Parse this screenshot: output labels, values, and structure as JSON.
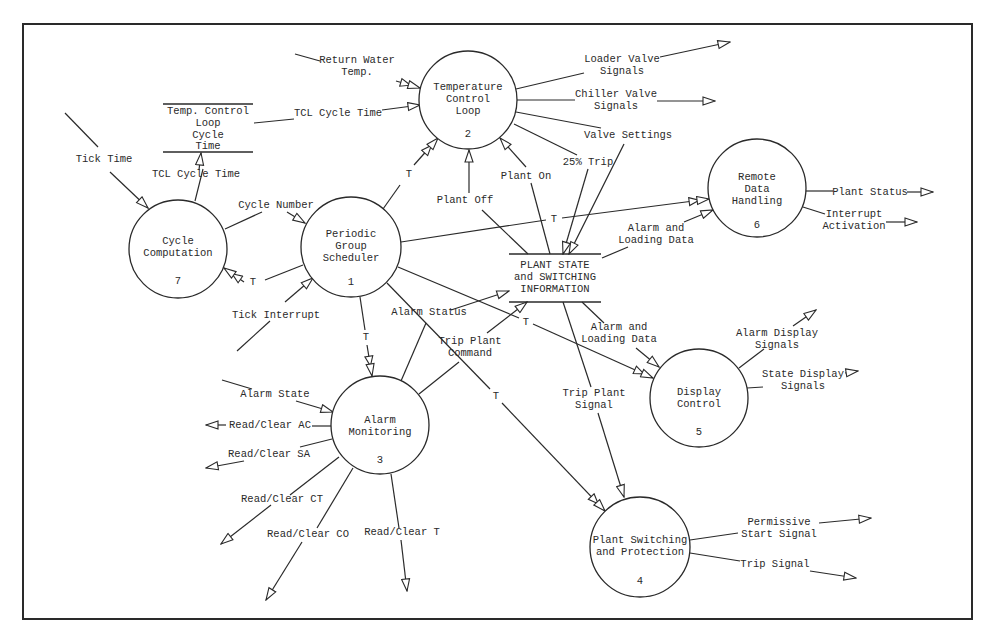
{
  "diagram": {
    "type": "data-flow-diagram",
    "processes": [
      {
        "id": "1",
        "name": "Periodic Group Scheduler",
        "lines": [
          "Periodic",
          "Group",
          "Scheduler"
        ],
        "number": "1",
        "cx": 351,
        "cy": 247,
        "r": 50
      },
      {
        "id": "2",
        "name": "Temperature Control Loop",
        "lines": [
          "Temperature",
          "Control",
          "Loop"
        ],
        "number": "2",
        "cx": 468,
        "cy": 100,
        "r": 49
      },
      {
        "id": "3",
        "name": "Alarm Monitoring",
        "lines": [
          "Alarm",
          "Monitoring"
        ],
        "number": "3",
        "cx": 380,
        "cy": 425,
        "r": 49
      },
      {
        "id": "4",
        "name": "Plant Switching and Protection",
        "lines": [
          "Plant Switching",
          "and Protection"
        ],
        "number": "4",
        "cx": 640,
        "cy": 547,
        "r": 50
      },
      {
        "id": "5",
        "name": "Display Control",
        "lines": [
          "Display",
          "Control"
        ],
        "number": "5",
        "cx": 699,
        "cy": 398,
        "r": 49
      },
      {
        "id": "6",
        "name": "Remote Data Handling",
        "lines": [
          "Remote",
          "Data",
          "Handling"
        ],
        "number": "6",
        "cx": 757,
        "cy": 188,
        "r": 49
      },
      {
        "id": "7",
        "name": "Cycle Computation",
        "lines": [
          "Cycle",
          "Computation"
        ],
        "number": "7",
        "cx": 178,
        "cy": 249,
        "r": 49
      }
    ],
    "data_stores": [
      {
        "id": "tcl-store",
        "lines": [
          "Temp. Control",
          "Loop",
          "Cycle",
          "Time"
        ]
      },
      {
        "id": "plant-store",
        "lines": [
          "PLANT STATE",
          "and SWITCHING",
          "INFORMATION"
        ]
      }
    ],
    "flow_labels": {
      "return_water_temp": [
        "Return Water",
        "Temp."
      ],
      "tcl_cycle_time_to_tcl": "TCL Cycle Time",
      "tcl_cycle_time_from_cc": "TCL Cycle Time",
      "tick_time": "Tick Time",
      "cycle_number": "Cycle Number",
      "t_to_cc": "T",
      "tick_interrupt": "Tick Interrupt",
      "t_to_tcl": "T",
      "t_to_rdh": "T",
      "t_to_am": "T",
      "t_to_dc": "T",
      "t_to_psp": "T",
      "plant_off": "Plant Off",
      "plant_on": "Plant On",
      "loader_valve_signals": [
        "Loader Valve",
        "Signals"
      ],
      "chiller_valve_signals": [
        "Chiller Valve",
        "Signals"
      ],
      "valve_settings": "Valve Settings",
      "trip_25": "25% Trip",
      "alarm_loading_to_rdh": [
        "Alarm and",
        "Loading Data"
      ],
      "alarm_loading_to_dc": [
        "Alarm and",
        "Loading Data"
      ],
      "plant_status": "Plant Status",
      "interrupt_activation": [
        "Interrupt",
        "Activation"
      ],
      "alarm_status": "Alarm Status",
      "trip_plant_command": [
        "Trip Plant",
        "Command"
      ],
      "trip_plant_signal": [
        "Trip Plant",
        "Signal"
      ],
      "alarm_state": "Alarm State",
      "read_clear_ac": "Read/Clear AC",
      "read_clear_sa": "Read/Clear SA",
      "read_clear_ct": "Read/Clear CT",
      "read_clear_co": "Read/Clear CO",
      "read_clear_t": "Read/Clear T",
      "alarm_display_signals": [
        "Alarm Display",
        "Signals"
      ],
      "state_display_signals": [
        "State Display",
        "Signals"
      ],
      "permissive_start_signal": [
        "Permissive",
        "Start Signal"
      ],
      "trip_signal": "Trip Signal"
    },
    "colors": {
      "ink": "#2a2a2a",
      "background": "#ffffff"
    }
  }
}
